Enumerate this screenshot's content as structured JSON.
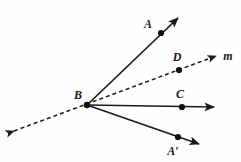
{
  "diagram": {
    "background_color": "#fefefe",
    "stroke_color": "#1a1a1a",
    "point_color": "#111111",
    "vertex": {
      "id": "B",
      "label": "B",
      "x": 87,
      "y": 105,
      "label_x": 78,
      "label_y": 99
    },
    "points": [
      {
        "id": "A",
        "label": "A",
        "x": 161,
        "y": 33,
        "label_x": 148,
        "label_y": 28,
        "radius": 3.1
      },
      {
        "id": "D",
        "label": "D",
        "x": 179,
        "y": 70,
        "label_x": 177,
        "label_y": 61,
        "radius": 3.1
      },
      {
        "id": "C",
        "label": "C",
        "x": 182,
        "y": 107,
        "label_x": 180,
        "label_y": 98,
        "radius": 3.1
      },
      {
        "id": "Aprime",
        "label": "A′",
        "x": 178,
        "y": 137,
        "label_x": 173,
        "label_y": 155,
        "radius": 3.1
      }
    ],
    "rays": [
      {
        "id": "ray-BA",
        "name": "ray-b-to-a",
        "style": "solid",
        "from_x": 87,
        "from_y": 105,
        "to_x": 178,
        "to_y": 18,
        "arrow": "end",
        "width": 1.6
      },
      {
        "id": "ray-BC",
        "name": "ray-b-to-c",
        "style": "solid",
        "from_x": 87,
        "from_y": 105,
        "to_x": 214,
        "to_y": 107,
        "arrow": "end",
        "width": 1.6
      },
      {
        "id": "ray-BAprime",
        "name": "ray-b-to-a-prime",
        "style": "solid",
        "from_x": 87,
        "from_y": 105,
        "to_x": 199,
        "to_y": 144,
        "arrow": "end",
        "width": 1.6
      }
    ],
    "lines": [
      {
        "id": "line-m",
        "name": "dashed-line-m",
        "label": "m",
        "style": "dashed",
        "dash_pattern": "4,3",
        "from_x": 14,
        "from_y": 131,
        "to_x": 216,
        "to_y": 56,
        "arrow": "both",
        "width": 1.5,
        "label_x": 228,
        "label_y": 60
      }
    ]
  }
}
